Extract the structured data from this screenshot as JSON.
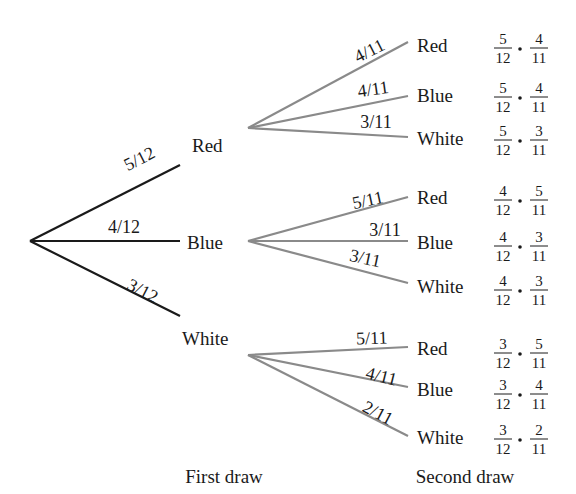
{
  "title": "",
  "colors": {
    "first_level_line": "#1a1a1a",
    "second_level_line": "#8a8a8a",
    "text": "#1a1a1a",
    "background": "#ffffff"
  },
  "root": {
    "x": 30,
    "y": 241
  },
  "first_draw": {
    "axis_label": "First draw",
    "axis_label_pos": {
      "x": 224,
      "y": 483
    },
    "branches": [
      {
        "outcome": "Red",
        "prob": "5/12",
        "end": {
          "x": 180,
          "y": 165
        },
        "label_pos": {
          "x": 192,
          "y": 152
        },
        "prob_pos": {
          "x": 142,
          "y": 164
        },
        "prob_angle": -27
      },
      {
        "outcome": "Blue",
        "prob": "4/12",
        "end": {
          "x": 180,
          "y": 241
        },
        "label_pos": {
          "x": 187,
          "y": 249
        },
        "prob_pos": {
          "x": 124,
          "y": 233
        },
        "prob_angle": 0
      },
      {
        "outcome": "White",
        "prob": "3/12",
        "end": {
          "x": 180,
          "y": 316
        },
        "label_pos": {
          "x": 182,
          "y": 345
        },
        "prob_pos": {
          "x": 140,
          "y": 296
        },
        "prob_angle": 27
      }
    ]
  },
  "second_draw": {
    "axis_label": "Second draw",
    "axis_label_pos": {
      "x": 465,
      "y": 483
    },
    "groups": [
      {
        "parent": "Red",
        "origin": {
          "x": 248,
          "y": 128
        },
        "branches": [
          {
            "outcome": "Red",
            "prob": "4/11",
            "end": {
              "x": 408,
              "y": 42
            },
            "label_pos": {
              "x": 417,
              "y": 52
            },
            "prob_pos": {
              "x": 372,
              "y": 56
            },
            "prob_angle": -27,
            "product": {
              "n1": "5",
              "d1": "12",
              "n2": "4",
              "d2": "11"
            },
            "product_y": 48
          },
          {
            "outcome": "Blue",
            "prob": "4/11",
            "end": {
              "x": 408,
              "y": 96
            },
            "label_pos": {
              "x": 417,
              "y": 102
            },
            "prob_pos": {
              "x": 374,
              "y": 95
            },
            "prob_angle": -8,
            "product": {
              "n1": "5",
              "d1": "12",
              "n2": "4",
              "d2": "11"
            },
            "product_y": 97
          },
          {
            "outcome": "White",
            "prob": "3/11",
            "end": {
              "x": 408,
              "y": 137
            },
            "label_pos": {
              "x": 417,
              "y": 145
            },
            "prob_pos": {
              "x": 376,
              "y": 128
            },
            "prob_angle": 0,
            "product": {
              "n1": "5",
              "d1": "12",
              "n2": "3",
              "d2": "11"
            },
            "product_y": 140
          }
        ]
      },
      {
        "parent": "Blue",
        "origin": {
          "x": 248,
          "y": 241
        },
        "branches": [
          {
            "outcome": "Red",
            "prob": "5/11",
            "end": {
              "x": 408,
              "y": 197
            },
            "label_pos": {
              "x": 417,
              "y": 204
            },
            "prob_pos": {
              "x": 369,
              "y": 206
            },
            "prob_angle": -12,
            "product": {
              "n1": "4",
              "d1": "12",
              "n2": "5",
              "d2": "11"
            },
            "product_y": 200
          },
          {
            "outcome": "Blue",
            "prob": "3/11",
            "end": {
              "x": 408,
              "y": 241
            },
            "label_pos": {
              "x": 417,
              "y": 249
            },
            "prob_pos": {
              "x": 385,
              "y": 236
            },
            "prob_angle": 0,
            "product": {
              "n1": "4",
              "d1": "12",
              "n2": "3",
              "d2": "11"
            },
            "product_y": 246
          },
          {
            "outcome": "White",
            "prob": "3/11",
            "end": {
              "x": 408,
              "y": 283
            },
            "label_pos": {
              "x": 417,
              "y": 293
            },
            "prob_pos": {
              "x": 364,
              "y": 264
            },
            "prob_angle": 12,
            "product": {
              "n1": "4",
              "d1": "12",
              "n2": "3",
              "d2": "11"
            },
            "product_y": 290
          }
        ]
      },
      {
        "parent": "White",
        "origin": {
          "x": 248,
          "y": 355
        },
        "branches": [
          {
            "outcome": "Red",
            "prob": "5/11",
            "end": {
              "x": 408,
              "y": 347
            },
            "label_pos": {
              "x": 417,
              "y": 355
            },
            "prob_pos": {
              "x": 372,
              "y": 344
            },
            "prob_angle": -2,
            "product": {
              "n1": "3",
              "d1": "12",
              "n2": "5",
              "d2": "11"
            },
            "product_y": 353
          },
          {
            "outcome": "Blue",
            "prob": "4/11",
            "end": {
              "x": 408,
              "y": 387
            },
            "label_pos": {
              "x": 417,
              "y": 396
            },
            "prob_pos": {
              "x": 380,
              "y": 382
            },
            "prob_angle": 14,
            "product": {
              "n1": "3",
              "d1": "12",
              "n2": "4",
              "d2": "11"
            },
            "product_y": 394
          },
          {
            "outcome": "White",
            "prob": "2/11",
            "end": {
              "x": 408,
              "y": 436
            },
            "label_pos": {
              "x": 417,
              "y": 444
            },
            "prob_pos": {
              "x": 375,
              "y": 418
            },
            "prob_angle": 28,
            "product": {
              "n1": "3",
              "d1": "12",
              "n2": "2",
              "d2": "11"
            },
            "product_y": 439
          }
        ]
      }
    ]
  },
  "product_layout": {
    "frac1_x": 503,
    "dot_x": 520,
    "frac2_x": 539,
    "bar_half_width": 9
  }
}
